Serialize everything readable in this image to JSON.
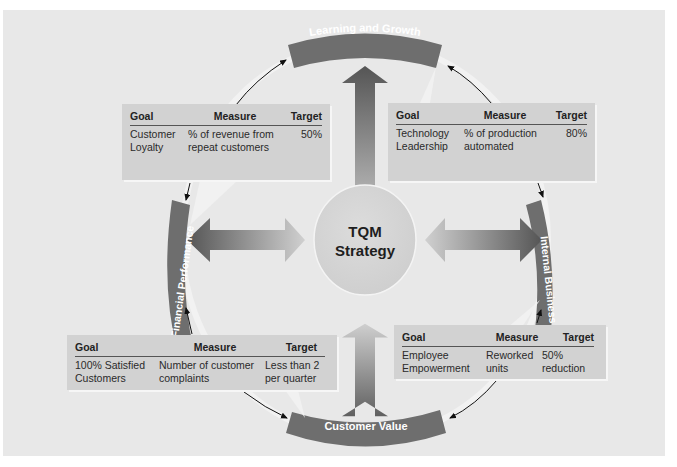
{
  "center": {
    "line1": "TQM",
    "line2": "Strategy"
  },
  "perspectives": {
    "top": "Learning and Growth",
    "right": "Internal Business",
    "bottom": "Customer Value",
    "left": "Financial Performance"
  },
  "table_headers": {
    "goal": "Goal",
    "measure": "Measure",
    "target": "Target"
  },
  "boxes": {
    "top_left": {
      "goal": "Customer\n  Loyalty",
      "measure": "% of revenue from\n   repeat customers",
      "target": "50%"
    },
    "top_right": {
      "goal": "Technology\n  Leadership",
      "measure": "% of production\n  automated",
      "target": "80%"
    },
    "bottom_left": {
      "goal": "100% Satisfied\n  Customers",
      "measure": "Number of customer\n   complaints",
      "target": "Less than 2\n  per quarter"
    },
    "bottom_right": {
      "goal": "Employee\n  Empowerment",
      "measure": "Reworked\n   units",
      "target": "50%\n    reduction"
    }
  },
  "colors": {
    "band": "#6e6e6e",
    "arrow_dark": "#5a5a5a",
    "arrow_light": "#c8c8c8",
    "box": "#d2d2d2",
    "background": "#e8e8e8",
    "center": "#d6d6d6"
  }
}
